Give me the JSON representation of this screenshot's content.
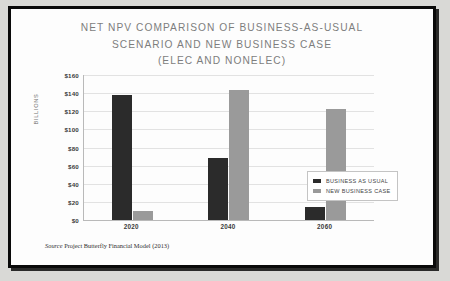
{
  "chart_data": {
    "type": "bar",
    "title": "NET NPV COMPARISON OF BUSINESS-AS-USUAL SCENARIO AND NEW BUSINESS CASE (ELEC AND NONELEC)",
    "title_lines": [
      "NET NPV COMPARISON OF BUSINESS-AS-USUAL",
      "SCENARIO AND NEW BUSINESS CASE",
      "(ELEC AND NONELEC)"
    ],
    "categories": [
      "2020",
      "2040",
      "2060"
    ],
    "series": [
      {
        "name": "BUSINESS AS USUAL",
        "color": "#2b2b2b",
        "values": [
          138,
          68,
          14
        ]
      },
      {
        "name": "NEW BUSINESS CASE",
        "color": "#9a9a9a",
        "values": [
          10,
          144,
          122
        ]
      }
    ],
    "xlabel": "",
    "ylabel": "BILLIONS",
    "ylim": [
      0,
      160
    ],
    "ytick_step": 20,
    "ytick_labels": [
      "$160",
      "$140",
      "$120",
      "$100",
      "$80",
      "$60",
      "$40",
      "$20",
      "$0"
    ],
    "ytick_values": [
      160,
      140,
      120,
      100,
      80,
      60,
      40,
      20,
      0
    ],
    "grid": true,
    "legend_position": "upper-right-inside",
    "value_prefix": "$",
    "source_note_prefix": "Source",
    "source_note": "Project Butterfly Financial Model (2013)"
  },
  "frame": {
    "border_color": "#0a0a0a",
    "background": "#d9d9d6"
  }
}
